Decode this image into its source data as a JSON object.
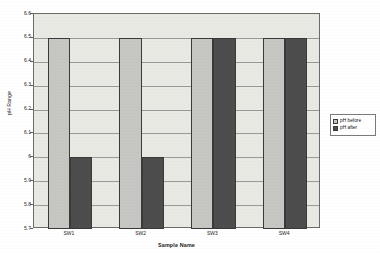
{
  "chart_data": {
    "type": "bar",
    "title": "",
    "xlabel": "Sample Name",
    "ylabel": "pH Range",
    "categories": [
      "SW1",
      "SW2",
      "SW3",
      "SW4"
    ],
    "series": [
      {
        "name": "pH before",
        "values": [
          6.5,
          6.5,
          6.5,
          6.5
        ],
        "color": "#c6c6c2"
      },
      {
        "name": "pH after",
        "values": [
          6.0,
          6.0,
          6.5,
          6.5
        ],
        "color": "#4d4d4d"
      }
    ],
    "ylim": [
      5.7,
      6.6
    ],
    "ytick_labels": [
      "6.6",
      "6.5",
      "6.4",
      "6.3",
      "6.2",
      "6.1",
      "6",
      "5.9",
      "5.8",
      "5.7"
    ],
    "ytick_values": [
      6.6,
      6.5,
      6.4,
      6.3,
      6.2,
      6.1,
      6.0,
      5.9,
      5.8,
      5.7
    ],
    "ytick_step": 0.1,
    "grid": true,
    "grid_axis": "y",
    "legend_position": "right",
    "plot_background": "#e9e9e4",
    "axis_color": "#6b6b6b",
    "gridline_color": "#9a9a9a"
  },
  "legend": {
    "entries": [
      {
        "label": "pH before"
      },
      {
        "label": "pH after"
      }
    ]
  },
  "axes": {
    "y_title": "pH Range",
    "x_title": "Sample Name"
  }
}
